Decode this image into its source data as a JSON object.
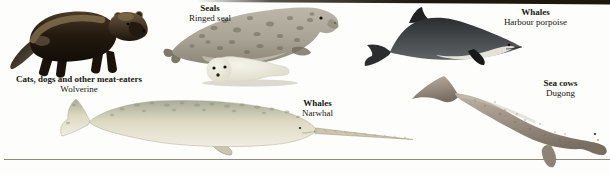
{
  "canvas": {
    "width": 610,
    "height": 175,
    "background": "#fdfdfb"
  },
  "decorations": {
    "top_edge_color": "#1c1810",
    "bottom_rule_color": "#8c897d"
  },
  "specimens": [
    {
      "figure": "wolverine",
      "group_label": "Cats, dogs and other meat-eaters",
      "name_label": "Wolverine",
      "colors": {
        "body": "#241a10",
        "flank_band": "#8a7550",
        "head": "#6b573c"
      }
    },
    {
      "figure": "ringed-seal",
      "group_label": "Seals",
      "name_label": "Ringed seal",
      "colors": {
        "adult_coat": "#a8a394",
        "spots": "#676253",
        "pup_coat": "#f6f4ea"
      }
    },
    {
      "figure": "harbour-porpoise",
      "group_label": "Whales",
      "name_label": "Harbour porpoise",
      "colors": {
        "back": "#2b2e30",
        "belly": "#eceadf"
      }
    },
    {
      "figure": "narwhal",
      "group_label": "Whales",
      "name_label": "Narwhal",
      "colors": {
        "body": "#ddd9c3",
        "mottling": "#8d937e",
        "tusk": "#cdc5ad"
      }
    },
    {
      "figure": "dugong",
      "group_label": "Sea cows",
      "name_label": "Dugong",
      "colors": {
        "body": "#9d9184"
      }
    }
  ]
}
